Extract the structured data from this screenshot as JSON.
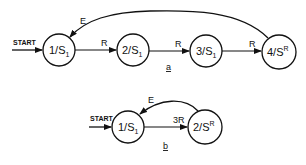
{
  "diagram_a": {
    "caption": "a",
    "start_label": "START",
    "states": [
      {
        "id": "1",
        "main": "1/S",
        "sub": "1",
        "sup": ""
      },
      {
        "id": "2",
        "main": "2/S",
        "sub": "1",
        "sup": ""
      },
      {
        "id": "3",
        "main": "3/S",
        "sub": "1",
        "sup": ""
      },
      {
        "id": "4",
        "main": "4/S",
        "sub": "",
        "sup": "R"
      }
    ],
    "transitions": [
      {
        "from": "1",
        "to": "2",
        "label": "R"
      },
      {
        "from": "2",
        "to": "3",
        "label": "R"
      },
      {
        "from": "3",
        "to": "4",
        "label": "R"
      },
      {
        "from": "4",
        "to": "1",
        "label": "E"
      }
    ]
  },
  "diagram_b": {
    "caption": "b",
    "start_label": "START",
    "states": [
      {
        "id": "1",
        "main": "1/S",
        "sub": "1",
        "sup": ""
      },
      {
        "id": "2",
        "main": "2/S",
        "sub": "",
        "sup": "R"
      }
    ],
    "transitions": [
      {
        "from": "1",
        "to": "2",
        "label": "3R"
      },
      {
        "from": "2",
        "to": "1",
        "label": "E"
      }
    ]
  }
}
